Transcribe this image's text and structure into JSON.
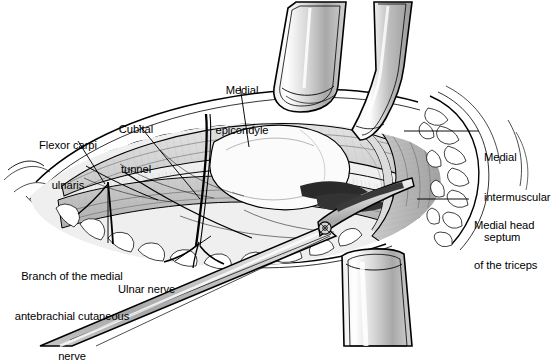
{
  "figure": {
    "background_color": "#ffffff",
    "line_color": "#000000",
    "muscle_fill": "#d9d9d9",
    "fat_fill": "#ffffff",
    "metal_light": "#fdfdfd",
    "metal_mid": "#c6c6c6",
    "metal_dark": "#8a8a8a",
    "shadow_dark": "#2b2b2b",
    "deep_fascia_fill": "#b3b3b3"
  },
  "labels": [
    {
      "id": "flexor-carpi-ulnaris",
      "lines": [
        "Flexor carpi",
        "ulnaris"
      ],
      "text": "Flexor carpi ulnaris",
      "align": "center",
      "x": 22,
      "y": 112,
      "leader": {
        "x1": 78,
        "y1": 141,
        "x2": 105,
        "y2": 184
      }
    },
    {
      "id": "cubital-tunnel",
      "lines": [
        "Cubital",
        "tunnel"
      ],
      "text": "Cubital tunnel",
      "align": "center",
      "x": 112,
      "y": 96,
      "leader": {
        "x1": 139,
        "y1": 125,
        "x2": 200,
        "y2": 199
      }
    },
    {
      "id": "medial-epicondyle",
      "lines": [
        "Medial",
        "epicondyle"
      ],
      "text": "Medial epicondyle",
      "align": "center",
      "x": 205,
      "y": 57,
      "leader": {
        "x1": 240,
        "y1": 86,
        "x2": 249,
        "y2": 147
      }
    },
    {
      "id": "medial-intermuscular-septum",
      "lines": [
        "Medial",
        "intermuscular",
        "septum"
      ],
      "text": "Medial intermuscular septum",
      "align": "left",
      "x": 484,
      "y": 124,
      "leader": {
        "x1": 479,
        "y1": 131,
        "x2": 404,
        "y2": 131
      }
    },
    {
      "id": "medial-head-of-the-triceps",
      "lines": [
        "Medial head",
        "of the triceps"
      ],
      "text": "Medial head of the triceps",
      "align": "left",
      "x": 474,
      "y": 192,
      "leader": {
        "x1": 469,
        "y1": 199,
        "x2": 417,
        "y2": 199
      }
    },
    {
      "id": "branch-of-the-medial-antebrachial-cutaneous-nerve",
      "lines": [
        "Branch of the medial",
        "antebrachial cutaneous",
        "nerve"
      ],
      "text": "Branch of the medial antebrachial cutaneous nerve",
      "align": "center",
      "x": 8,
      "y": 243,
      "leader": {
        "x1": 108,
        "y1": 243,
        "x2": 108,
        "y2": 182
      }
    },
    {
      "id": "ulnar-nerve",
      "lines": [
        "Ulnar nerve"
      ],
      "text": "Ulnar nerve",
      "align": "left",
      "x": 118,
      "y": 263,
      "leader": {
        "x1": 175,
        "y1": 261,
        "x2": 211,
        "y2": 236
      }
    }
  ],
  "instruments": [
    {
      "id": "retractor-blade-upper-left",
      "type": "army-navy-retractor"
    },
    {
      "id": "retractor-blade-upper-right",
      "type": "army-navy-retractor"
    },
    {
      "id": "retractor-blade-lower",
      "type": "army-navy-retractor"
    },
    {
      "id": "dissecting-scissors",
      "type": "metzenbaum-scissors"
    }
  ],
  "anatomy": [
    {
      "id": "skin-edge",
      "name": "skin incision edge"
    },
    {
      "id": "subcutaneous-fat",
      "name": "subcutaneous fat lobules"
    },
    {
      "id": "flexor-carpi-ulnaris-muscle",
      "name": "flexor carpi ulnaris"
    },
    {
      "id": "cubital-tunnel-roof",
      "name": "cubital tunnel retinaculum"
    },
    {
      "id": "medial-epicondyle-bone",
      "name": "medial epicondyle"
    },
    {
      "id": "ulnar-nerve-trunk",
      "name": "ulnar nerve"
    },
    {
      "id": "mabc-nerve-branch",
      "name": "medial antebrachial cutaneous nerve branch"
    },
    {
      "id": "medial-intermuscular-septum-band",
      "name": "medial intermuscular septum"
    },
    {
      "id": "triceps-medial-head",
      "name": "medial head of the triceps"
    }
  ]
}
